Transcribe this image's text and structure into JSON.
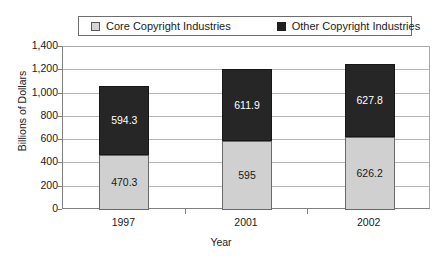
{
  "chart_data": {
    "type": "bar",
    "subtype": "stacked-bar",
    "title": "",
    "xlabel": "Year",
    "ylabel": "Billions of Dollars",
    "categories": [
      "1997",
      "2001",
      "2002"
    ],
    "series": [
      {
        "name": "Core Copyright Industries",
        "color": "#d0d0d0",
        "values": [
          470.3,
          595,
          626.2
        ],
        "labels": [
          "470.3",
          "595",
          "626.2"
        ]
      },
      {
        "name": "Other Copyright Industries",
        "color": "#262626",
        "values": [
          594.3,
          611.9,
          627.8
        ],
        "labels": [
          "594.3",
          "611.9",
          "627.8"
        ]
      }
    ],
    "totals": [
      1064.6,
      1206.9,
      1254.0
    ],
    "ylim": [
      0,
      1400
    ],
    "ytick_values": [
      0,
      200,
      400,
      600,
      800,
      1000,
      1200,
      1400
    ],
    "ytick_labels": [
      "0",
      "200",
      "400",
      "600",
      "800",
      "1,000",
      "1,200",
      "1,400"
    ],
    "grid": true,
    "grid_axis": "y",
    "legend_position": "top"
  },
  "legend": {
    "entries": [
      {
        "label": "Core Copyright Industries",
        "swatch": "light-gray-square"
      },
      {
        "label": "Other Copyright Industries",
        "swatch": "black-square"
      }
    ]
  },
  "axes": {
    "y_title": "Billions of Dollars",
    "x_title": "Year"
  }
}
